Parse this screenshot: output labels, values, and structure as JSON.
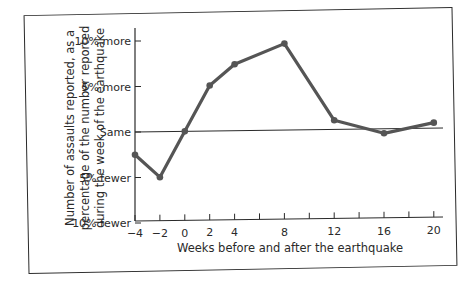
{
  "chart_data": {
    "type": "line",
    "title": "",
    "xlabel": "Weeks before and after the earthquake",
    "ylabel_lines": [
      "Number of assaults reported, as a",
      "percentage of the number reported",
      "during the week of the earthquake"
    ],
    "x_ticks": [
      -4,
      -2,
      0,
      2,
      4,
      6,
      8,
      10,
      12,
      14,
      16,
      18,
      20
    ],
    "x_tick_labels": [
      "−4",
      "−2",
      "0",
      "2",
      "4",
      "8",
      "12",
      "16",
      "20"
    ],
    "x_tick_label_values": [
      -4,
      -2,
      0,
      2,
      4,
      8,
      12,
      16,
      20
    ],
    "y_ticks": [
      -10,
      -5,
      0,
      5,
      10
    ],
    "y_tick_labels": [
      "10% fewer",
      "5% fewer",
      "Same",
      "5% more",
      "10% more"
    ],
    "xlim": [
      -4,
      21
    ],
    "ylim": [
      -10,
      11
    ],
    "grid": false,
    "reference_line": {
      "y": 0,
      "label": "Same"
    },
    "series": [
      {
        "name": "Assaults reported (% change vs. earthquake week)",
        "x": [
          -4,
          -2,
          0,
          2,
          4,
          8,
          12,
          16,
          20
        ],
        "values": [
          -2.5,
          -5,
          0,
          5,
          7.3,
          9.5,
          1,
          -0.5,
          0.6
        ],
        "color": "#555555"
      }
    ]
  }
}
